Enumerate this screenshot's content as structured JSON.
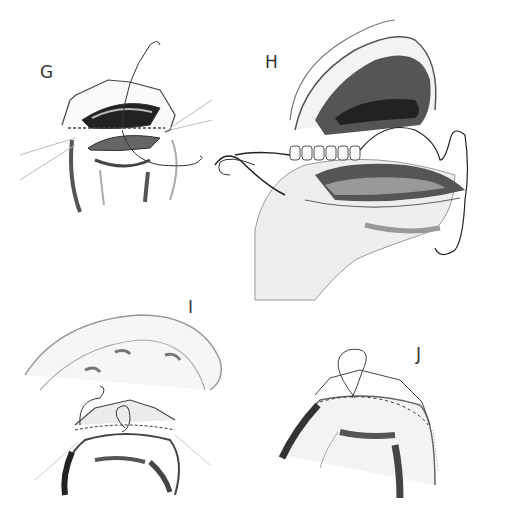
{
  "figure": {
    "type": "surgical illustration",
    "panels": [
      {
        "id": "G",
        "label": "G"
      },
      {
        "id": "H",
        "label": "H"
      },
      {
        "id": "I",
        "label": "I"
      },
      {
        "id": "J",
        "label": "J"
      }
    ]
  }
}
